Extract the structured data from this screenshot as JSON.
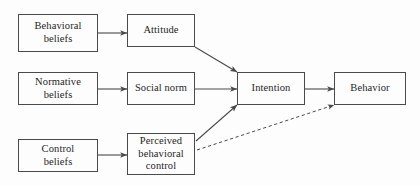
{
  "figure": {
    "type": "flow-diagram",
    "background_color": "#fdfdfd",
    "line_color": "#4a4a4a",
    "text_color": "#1d1d1d"
  },
  "nodes": [
    {
      "id": "behavioral-beliefs",
      "label": "Behavioral\nbeliefs",
      "x": 18,
      "y": 14,
      "w": 80,
      "h": 38
    },
    {
      "id": "attitude",
      "label": "Attitude",
      "x": 127,
      "y": 14,
      "w": 68,
      "h": 33
    },
    {
      "id": "normative-beliefs",
      "label": "Normative\nbeliefs",
      "x": 18,
      "y": 72,
      "w": 80,
      "h": 33
    },
    {
      "id": "social-norm",
      "label": "Social norm",
      "x": 127,
      "y": 72,
      "w": 68,
      "h": 33
    },
    {
      "id": "intention",
      "label": "Intention",
      "x": 237,
      "y": 72,
      "w": 68,
      "h": 33
    },
    {
      "id": "behavior",
      "label": "Behavior",
      "x": 334,
      "y": 72,
      "w": 72,
      "h": 33
    },
    {
      "id": "control-beliefs",
      "label": "Control\nbeliefs",
      "x": 18,
      "y": 139,
      "w": 80,
      "h": 33
    },
    {
      "id": "perceived-behavioral-control",
      "label": "Perceived\nbehavioral\ncontrol",
      "x": 127,
      "y": 133,
      "w": 68,
      "h": 42
    }
  ],
  "edges": [
    {
      "id": "behavioral-beliefs-to-attitude",
      "from": "behavioral-beliefs",
      "to": "attitude",
      "style": "solid",
      "x1": 98,
      "y1": 33,
      "x2": 127,
      "y2": 33
    },
    {
      "id": "normative-beliefs-to-social-norm",
      "from": "normative-beliefs",
      "to": "social-norm",
      "style": "solid",
      "x1": 98,
      "y1": 89,
      "x2": 127,
      "y2": 89
    },
    {
      "id": "control-beliefs-to-perceived-behavioral-control",
      "from": "control-beliefs",
      "to": "perceived-behavioral-control",
      "style": "solid",
      "x1": 98,
      "y1": 155,
      "x2": 127,
      "y2": 155
    },
    {
      "id": "attitude-to-intention",
      "from": "attitude",
      "to": "intention",
      "style": "solid",
      "x1": 195,
      "y1": 47,
      "x2": 237,
      "y2": 72
    },
    {
      "id": "social-norm-to-intention",
      "from": "social-norm",
      "to": "intention",
      "style": "solid",
      "x1": 195,
      "y1": 89,
      "x2": 237,
      "y2": 89
    },
    {
      "id": "perceived-behavioral-control-to-intention",
      "from": "perceived-behavioral-control",
      "to": "intention",
      "style": "solid",
      "x1": 196,
      "y1": 141,
      "x2": 237,
      "y2": 105
    },
    {
      "id": "intention-to-behavior",
      "from": "intention",
      "to": "behavior",
      "style": "solid",
      "x1": 305,
      "y1": 89,
      "x2": 334,
      "y2": 89
    },
    {
      "id": "perceived-behavioral-control-to-behavior",
      "from": "perceived-behavioral-control",
      "to": "behavior",
      "style": "dashed",
      "x1": 197,
      "y1": 150,
      "x2": 334,
      "y2": 105
    }
  ]
}
